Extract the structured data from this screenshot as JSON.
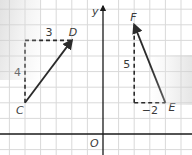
{
  "diagram": {
    "type": "coordinate-grid-vectors",
    "axes": {
      "y_label": "y",
      "origin_label": "O"
    },
    "vectors": [
      {
        "name": "CD",
        "from_label": "C",
        "to_label": "D",
        "from": [
          -5,
          2
        ],
        "to": [
          -2,
          6
        ],
        "horizontal_component_label": "3",
        "vertical_component_label": "4"
      },
      {
        "name": "EF",
        "from_label": "E",
        "to_label": "F",
        "from": [
          4,
          2
        ],
        "to": [
          2,
          7
        ],
        "horizontal_component_label": "−2",
        "vertical_component_label": "5"
      }
    ],
    "colors": {
      "grid": "#d9d9d9",
      "axis": "#1a1a1a",
      "vector": "#2b2b2b",
      "label": "#3a3a3a"
    }
  }
}
